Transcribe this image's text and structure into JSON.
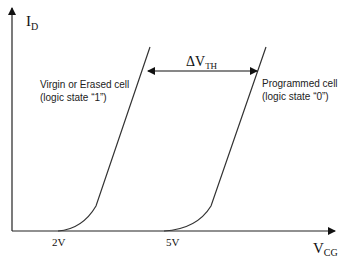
{
  "diagram": {
    "y_axis": {
      "label_main": "I",
      "label_sub": "D"
    },
    "x_axis": {
      "label_main": "V",
      "label_sub": "CG"
    },
    "ticks": [
      {
        "label": "2V"
      },
      {
        "label": "5V"
      }
    ],
    "curves": [
      {
        "name": "Virgin or Erased cell",
        "line1": "Virgin or Erased cell",
        "line2": "(logic state “1”)",
        "threshold": "2V"
      },
      {
        "name": "Programmed cell",
        "line1": "Programmed cell",
        "line2": "(logic state “0”)",
        "threshold": "5V"
      }
    ],
    "delta": {
      "label_main": "ΔV",
      "label_sub": "TH"
    },
    "colors": {
      "line": "#333333",
      "background": "#ffffff"
    }
  }
}
